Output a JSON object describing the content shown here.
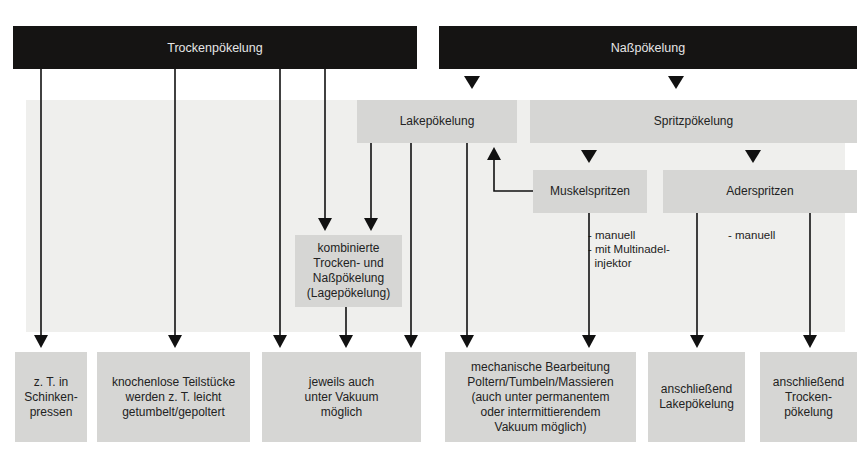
{
  "header": {
    "dry_curing": "Trockenpökelung",
    "wet_curing": "Naßpökelung"
  },
  "methods": {
    "brine_curing": "Lakepökelung",
    "spray_curing": "Spritzpökelung",
    "muscle_injection": "Muskelspritzen",
    "artery_injection": "Aderspritzen",
    "combined": "kombinierte\nTrocken- und\nNaßpökelung\n(Lagepökelung)"
  },
  "notes": {
    "muscle_injection": "- manuell\n- mit Multinadel-\n  injektor",
    "artery_injection": "- manuell"
  },
  "results": [
    {
      "label": "z. T. in\nSchinken-\npressen"
    },
    {
      "label": "knochenlose Teilstücke\nwerden z. T. leicht\ngetumbelt/gepoltert"
    },
    {
      "label": "jeweils auch\nunter Vakuum\nmöglich"
    },
    {
      "label": "mechanische Bearbeitung\nPoltern/Tumbeln/Massieren\n(auch unter permanentem\noder intermittierendem\nVakuum möglich)"
    },
    {
      "label": "anschließend\nLakepökelung"
    },
    {
      "label": "anschließend\nTrocken-\npökelung"
    }
  ],
  "colors": {
    "header_bg": "#151413",
    "box_bg": "#d6d6d4",
    "panel_bg": "#efefed",
    "line": "#111111"
  }
}
